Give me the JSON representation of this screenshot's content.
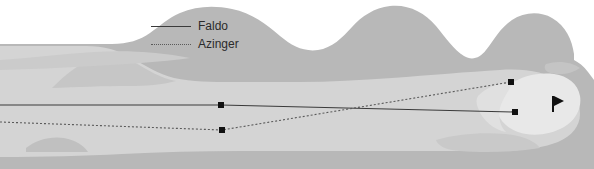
{
  "diagram": {
    "type": "golf-hole-overhead-map"
  },
  "legend": {
    "position": "top-center",
    "entries": [
      {
        "label": "Faldo",
        "line_style": "solid",
        "color": "#3a3a3a"
      },
      {
        "label": "Azinger",
        "line_style": "dotted",
        "color": "#5a5a5a"
      }
    ]
  },
  "colors": {
    "background": "#ffffff",
    "rough": "#b8b8b8",
    "fairway": "#d4d4d4",
    "green": "#e8e8e8",
    "bunker": "#c4c4c4",
    "faldo_line": "#3a3a3a",
    "azinger_line": "#5a5a5a",
    "marker": "#111111",
    "flag": "#111111"
  },
  "chart_data": {
    "type": "scatter",
    "xlabel": "",
    "ylabel": "",
    "xlim": [
      0,
      594
    ],
    "ylim": [
      0,
      169
    ],
    "grid": false,
    "legend_position": "top-center",
    "series": [
      {
        "name": "Faldo",
        "line_style": "solid",
        "color": "#3a3a3a",
        "points": [
          {
            "x": 0,
            "y": 105,
            "marker": false
          },
          {
            "x": 221,
            "y": 105,
            "marker": true
          },
          {
            "x": 515,
            "y": 112,
            "marker": true
          }
        ]
      },
      {
        "name": "Azinger",
        "line_style": "dotted",
        "color": "#5a5a5a",
        "points": [
          {
            "x": 0,
            "y": 122,
            "marker": false
          },
          {
            "x": 222,
            "y": 130,
            "marker": true
          },
          {
            "x": 511,
            "y": 82,
            "marker": true
          }
        ]
      }
    ],
    "annotations": [
      {
        "name": "pin-flag",
        "x": 554,
        "y": 104,
        "label": ""
      }
    ]
  },
  "features": {
    "green_label": "green",
    "fairway_label": "fairway",
    "rough_label": "rough",
    "pin_label": "pin"
  }
}
